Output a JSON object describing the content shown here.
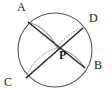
{
  "figure": {
    "type": "geometry-diagram",
    "width": 112,
    "height": 97,
    "background_color": "#ffffff",
    "stroke_color": "#2b2b2b",
    "circle_stroke_color": "#555555",
    "arc_stroke_color": "#777777",
    "dotted_arc_color": "#8a8a8a"
  },
  "circle": {
    "name": "main-circle",
    "center_x": 55,
    "center_y": 50,
    "radius": 37,
    "stroke_width": 1.1
  },
  "points": [
    {
      "id": "A",
      "label": "A",
      "x": 28,
      "y": 22,
      "label_x": 17,
      "label_y": 1,
      "on_circle": true
    },
    {
      "id": "D",
      "label": "D",
      "x": 83,
      "y": 28,
      "label_x": 89,
      "label_y": 12,
      "on_circle": true
    },
    {
      "id": "B",
      "label": "B",
      "x": 85,
      "y": 68,
      "label_x": 94,
      "label_y": 59,
      "on_circle": true
    },
    {
      "id": "C",
      "label": "C",
      "x": 26,
      "y": 78,
      "label_x": 4,
      "label_y": 76,
      "on_circle": true
    },
    {
      "id": "P",
      "label": "P",
      "x": 57,
      "y": 48,
      "label_x": 59,
      "label_y": 49,
      "on_circle": false
    }
  ],
  "chords": [
    {
      "id": "AB",
      "from": "A",
      "to": "B",
      "style": "solid",
      "stroke_width": 1.6
    },
    {
      "id": "CD",
      "from": "C",
      "to": "D",
      "style": "solid",
      "stroke_width": 1.6
    }
  ],
  "arcs": [
    {
      "id": "arc-A-P",
      "from": "A",
      "to": "P",
      "style": "solid",
      "sweep": 1,
      "radius": 44
    },
    {
      "id": "arc-P-B",
      "from": "P",
      "to": "B",
      "style": "solid",
      "sweep": 1,
      "radius": 44
    },
    {
      "id": "arc-C-P",
      "from": "C",
      "to": "P",
      "style": "dotted",
      "sweep": 1,
      "radius": 46
    },
    {
      "id": "arc-D-P",
      "from": "D",
      "to": "P",
      "style": "dotted",
      "sweep": 1,
      "radius": 46
    }
  ],
  "labels": {
    "A": "A",
    "B": "B",
    "C": "C",
    "D": "D",
    "P": "P"
  }
}
